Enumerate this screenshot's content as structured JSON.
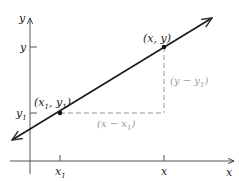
{
  "diagram": {
    "axes": {
      "x_label": "x",
      "y_label": "y",
      "x_ticks": [
        {
          "label": "x",
          "sub": "1"
        },
        {
          "label": "x",
          "sub": ""
        }
      ],
      "y_ticks": [
        {
          "label": "y",
          "sub": "1"
        },
        {
          "label": "y",
          "sub": ""
        }
      ]
    },
    "points": [
      {
        "id": "p1",
        "label_open": "(x",
        "label_sub1": "1",
        "label_mid": ", y",
        "label_sub2": "1",
        "label_close": ")"
      },
      {
        "id": "p2",
        "label": "(x, y)"
      }
    ],
    "differences": {
      "horizontal": {
        "text": "(x − x",
        "sub": "1",
        "close": ")"
      },
      "vertical": {
        "text": "(y − y",
        "sub": "1",
        "close": ")"
      }
    },
    "colors": {
      "line": "#1a1a1a",
      "axis": "#444444",
      "dashed": "#9a9a9a"
    }
  }
}
